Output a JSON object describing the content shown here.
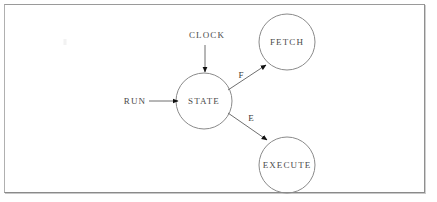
{
  "diagram": {
    "background_color": "#ffffff",
    "stroke_color": "#7a7a7a",
    "text_color": "#4a4a4a",
    "frame_color": "#9a9a9a",
    "nodes": [
      {
        "id": "state",
        "label": "STATE",
        "cx": 204,
        "cy": 101,
        "r": 28
      },
      {
        "id": "fetch",
        "label": "FETCH",
        "cx": 287,
        "cy": 42,
        "r": 28
      },
      {
        "id": "execute",
        "label": "EXECUTE",
        "cx": 287,
        "cy": 165,
        "r": 28
      }
    ],
    "inputs": [
      {
        "id": "clock",
        "label": "CLOCK",
        "label_x": 207,
        "label_y": 35,
        "direction": "down",
        "target": "state"
      },
      {
        "id": "run",
        "label": "RUN",
        "label_x": 135,
        "label_y": 101,
        "direction": "right",
        "target": "state"
      }
    ],
    "edges": [
      {
        "id": "state-to-fetch",
        "label": "F",
        "label_x": 241,
        "label_y": 75,
        "from": "state",
        "to": "fetch"
      },
      {
        "id": "state-to-execute",
        "label": "E",
        "label_x": 251,
        "label_y": 118,
        "from": "state",
        "to": "execute"
      }
    ]
  }
}
